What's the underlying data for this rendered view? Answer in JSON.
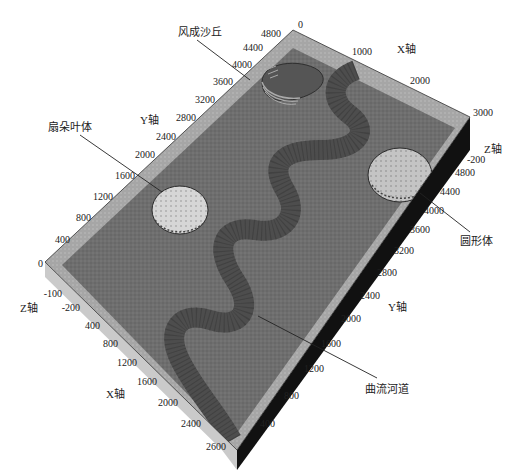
{
  "figure": {
    "type": "3d-block-geological-model",
    "colors": {
      "background": "#ffffff",
      "top_border": "#a9a9a9",
      "base_surface": "#6e6e6e",
      "channel": "#4f4f4f",
      "channel_edge": "#2a2a2a",
      "fan_lobe": "#cfcfcf",
      "circular_body": "#bdbdbd",
      "dune": "#5a5a5a",
      "dune_stripe": "#a8a8a8",
      "side_face": "#111111",
      "text": "#222222"
    },
    "annotations": {
      "dune": "风成沙丘",
      "fan_lobe": "扇朵叶体",
      "circular_body": "圆形体",
      "meandering_channel": "曲流河道"
    },
    "axes": {
      "x_label": "X轴",
      "y_label": "Y轴",
      "z_label": "Z轴",
      "x_label_left": "X轴",
      "y_label_right": "Y轴",
      "z_label_right": "Z轴",
      "top_x_ticks": [
        "0",
        "1000",
        "2000",
        "3000"
      ],
      "left_y_ticks": [
        "4800",
        "4400",
        "4000",
        "3600",
        "3200",
        "2800",
        "2400",
        "2000",
        "1600",
        "1200",
        "800",
        "400",
        "0"
      ],
      "left_z_ticks": [
        "-100",
        "-200"
      ],
      "left_x_ticks": [
        "400",
        "800",
        "1200",
        "1600",
        "2000",
        "2400",
        "2600"
      ],
      "right_z_ticks": [
        "-200"
      ],
      "right_y_ticks": [
        "4800",
        "4400",
        "4000",
        "3600",
        "3200",
        "2800",
        "2400",
        "2000",
        "1600",
        "1200",
        "800",
        "400"
      ]
    }
  }
}
